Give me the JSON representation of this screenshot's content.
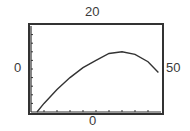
{
  "window": {
    "ymax_label": "20",
    "xmin_label": "0",
    "xmax_label": "50",
    "ymin_label": "0"
  },
  "chart_data": {
    "type": "line",
    "title": "",
    "xlabel": "",
    "ylabel": "",
    "xlim": [
      0,
      50
    ],
    "ylim": [
      0,
      20
    ],
    "grid": false,
    "x_tick_step": 5,
    "y_tick_step": 2,
    "series": [
      {
        "name": "curve",
        "x": [
          2.3,
          5,
          10,
          15,
          20,
          25,
          30,
          35,
          40,
          45,
          49
        ],
        "y": [
          0,
          2.0,
          5.2,
          8.0,
          10.3,
          12.0,
          13.6,
          14.0,
          13.4,
          11.7,
          9.2
        ]
      }
    ],
    "colors": {
      "frame": "#333333",
      "curve": "#333333",
      "background": "#ffffff"
    }
  }
}
